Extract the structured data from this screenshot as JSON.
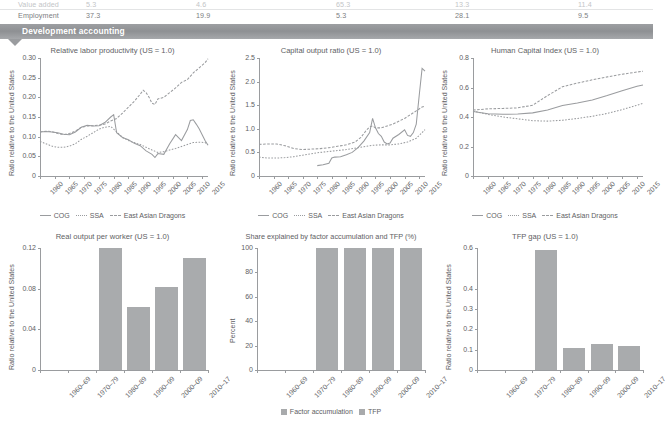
{
  "table_remnant": {
    "rows": [
      {
        "label": "Value added",
        "values": [
          "5.3",
          "4.6",
          "65.3",
          "13.3",
          "11.4"
        ]
      },
      {
        "label": "Employment",
        "values": [
          "37.3",
          "19.9",
          "5.3",
          "28.1",
          "9.5"
        ]
      }
    ]
  },
  "banner": {
    "title": "Development accounting"
  },
  "legend_lines": {
    "cog": "COG",
    "ssa": "SSA",
    "dragons": "East Asian Dragons"
  },
  "legend_bars": {
    "factor": "Factor accumulation",
    "tfp": "TFP"
  },
  "colors": {
    "line": "#9a9c9f",
    "bar": "#a9abad",
    "banner": "#9a9c9f",
    "text": "#5e6063"
  },
  "chart_data": [
    {
      "id": "relative-labor-productivity",
      "type": "line",
      "title": "Relative labor productivity (US = 1.0)",
      "xlabel": "",
      "ylabel": "Ratio relative to the United States",
      "xlim": [
        1960,
        2017
      ],
      "ylim": [
        0,
        0.3
      ],
      "yticks": [
        0,
        0.05,
        0.1,
        0.15,
        0.2,
        0.25,
        0.3
      ],
      "ytick_labels": [
        "0",
        "0.05",
        "0.10",
        "0.15",
        "0.20",
        "0.25",
        "0.30"
      ],
      "xticks": [
        1960,
        1965,
        1970,
        1975,
        1980,
        1985,
        1990,
        1995,
        2000,
        2005,
        2010,
        2015
      ],
      "xtick_labels": [
        "1960",
        "1965",
        "1970",
        "1975",
        "1980",
        "1985",
        "1990",
        "1995",
        "2000",
        "2005",
        "2010",
        "2015"
      ],
      "grid": false,
      "legend_position": "bottom",
      "series": [
        {
          "name": "COG",
          "style": "solid",
          "x": [
            1960,
            1962,
            1964,
            1966,
            1968,
            1970,
            1972,
            1974,
            1976,
            1978,
            1980,
            1982,
            1984,
            1985,
            1986,
            1988,
            1990,
            1992,
            1994,
            1996,
            1998,
            1999,
            2000,
            2002,
            2004,
            2006,
            2008,
            2010,
            2011,
            2012,
            2013,
            2014,
            2016,
            2017
          ],
          "y": [
            0.112,
            0.113,
            0.112,
            0.11,
            0.106,
            0.105,
            0.112,
            0.124,
            0.129,
            0.127,
            0.128,
            0.136,
            0.15,
            0.156,
            0.11,
            0.098,
            0.092,
            0.083,
            0.077,
            0.064,
            0.055,
            0.047,
            0.057,
            0.055,
            0.082,
            0.105,
            0.09,
            0.118,
            0.141,
            0.143,
            0.132,
            0.12,
            0.09,
            0.078
          ]
        },
        {
          "name": "SSA",
          "style": "dot",
          "x": [
            1960,
            1962,
            1964,
            1966,
            1968,
            1970,
            1972,
            1974,
            1976,
            1978,
            1980,
            1982,
            1984,
            1986,
            1988,
            1990,
            1992,
            1994,
            1996,
            1998,
            2000,
            2002,
            2004,
            2006,
            2008,
            2010,
            2012,
            2014,
            2016,
            2017
          ],
          "y": [
            0.088,
            0.082,
            0.076,
            0.073,
            0.073,
            0.076,
            0.082,
            0.093,
            0.101,
            0.11,
            0.119,
            0.124,
            0.126,
            0.112,
            0.098,
            0.09,
            0.085,
            0.08,
            0.073,
            0.066,
            0.06,
            0.062,
            0.066,
            0.07,
            0.075,
            0.08,
            0.085,
            0.086,
            0.085,
            0.08
          ]
        },
        {
          "name": "East Asian Dragons",
          "style": "dash",
          "x": [
            1960,
            1962,
            1964,
            1966,
            1968,
            1970,
            1972,
            1974,
            1976,
            1978,
            1980,
            1982,
            1984,
            1986,
            1988,
            1990,
            1992,
            1994,
            1995,
            1996,
            1997,
            1998,
            1999,
            2000,
            2002,
            2004,
            2006,
            2008,
            2010,
            2012,
            2014,
            2016,
            2017
          ],
          "y": [
            0.112,
            0.114,
            0.113,
            0.108,
            0.105,
            0.108,
            0.114,
            0.124,
            0.127,
            0.128,
            0.129,
            0.132,
            0.14,
            0.146,
            0.16,
            0.175,
            0.19,
            0.208,
            0.218,
            0.212,
            0.2,
            0.185,
            0.182,
            0.196,
            0.2,
            0.212,
            0.224,
            0.238,
            0.245,
            0.262,
            0.275,
            0.288,
            0.298
          ]
        }
      ]
    },
    {
      "id": "capital-output-ratio",
      "type": "line",
      "title": "Capital output ratio (US = 1.0)",
      "xlabel": "",
      "ylabel": "Ratio relative to the United States",
      "xlim": [
        1960,
        2017
      ],
      "ylim": [
        0,
        2.5
      ],
      "yticks": [
        0,
        0.5,
        1.0,
        1.5,
        2.0,
        2.5
      ],
      "ytick_labels": [
        "0",
        "0.5",
        "1.0",
        "1.5",
        "2.0",
        "2.5"
      ],
      "xticks": [
        1960,
        1965,
        1970,
        1975,
        1980,
        1985,
        1990,
        1995,
        2000,
        2005,
        2010,
        2015
      ],
      "xtick_labels": [
        "1960",
        "1965",
        "1970",
        "1975",
        "1980",
        "1985",
        "1990",
        "1995",
        "2000",
        "2005",
        "2010",
        "2015"
      ],
      "grid": false,
      "legend_position": "bottom",
      "series": [
        {
          "name": "COG",
          "style": "solid",
          "x": [
            1980,
            1982,
            1984,
            1985,
            1986,
            1988,
            1990,
            1992,
            1994,
            1996,
            1998,
            1999,
            2000,
            2001,
            2002,
            2003,
            2004,
            2005,
            2006,
            2008,
            2010,
            2011,
            2012,
            2013,
            2014,
            2015,
            2016,
            2017
          ],
          "y": [
            0.22,
            0.24,
            0.27,
            0.38,
            0.4,
            0.41,
            0.45,
            0.5,
            0.6,
            0.74,
            0.92,
            1.22,
            1.02,
            0.9,
            0.84,
            0.72,
            0.68,
            0.7,
            0.8,
            0.88,
            0.98,
            0.86,
            0.84,
            0.92,
            1.1,
            1.7,
            2.28,
            2.22
          ]
        },
        {
          "name": "SSA",
          "style": "dot",
          "x": [
            1960,
            1963,
            1966,
            1969,
            1972,
            1975,
            1978,
            1981,
            1984,
            1987,
            1990,
            1993,
            1996,
            1999,
            2002,
            2005,
            2008,
            2011,
            2014,
            2017
          ],
          "y": [
            0.4,
            0.38,
            0.38,
            0.39,
            0.41,
            0.44,
            0.47,
            0.5,
            0.52,
            0.54,
            0.56,
            0.59,
            0.62,
            0.65,
            0.66,
            0.66,
            0.68,
            0.72,
            0.8,
            0.98
          ]
        },
        {
          "name": "East Asian Dragons",
          "style": "dash",
          "x": [
            1960,
            1963,
            1966,
            1969,
            1972,
            1975,
            1978,
            1981,
            1984,
            1987,
            1990,
            1993,
            1995,
            1996,
            1997,
            1998,
            1999,
            2000,
            2002,
            2004,
            2006,
            2008,
            2010,
            2012,
            2014,
            2016,
            2017
          ],
          "y": [
            0.67,
            0.68,
            0.68,
            0.64,
            0.58,
            0.56,
            0.57,
            0.58,
            0.6,
            0.63,
            0.66,
            0.72,
            0.82,
            0.9,
            0.98,
            1.04,
            1.06,
            1.02,
            1.02,
            1.06,
            1.1,
            1.16,
            1.22,
            1.3,
            1.38,
            1.46,
            1.48
          ]
        }
      ]
    },
    {
      "id": "human-capital-index",
      "type": "line",
      "title": "Human Capital Index (US = 1.0)",
      "xlabel": "",
      "ylabel": "Ratio relative to the United States",
      "xlim": [
        1960,
        2017
      ],
      "ylim": [
        0,
        0.8
      ],
      "yticks": [
        0,
        0.2,
        0.4,
        0.6,
        0.8
      ],
      "ytick_labels": [
        "0",
        "0.2",
        "0.4",
        "0.6",
        "0.8"
      ],
      "xticks": [
        1960,
        1965,
        1970,
        1975,
        1980,
        1985,
        1990,
        1995,
        2000,
        2005,
        2010,
        2015
      ],
      "xtick_labels": [
        "1960",
        "1965",
        "1970",
        "1975",
        "1980",
        "1985",
        "1990",
        "1995",
        "2000",
        "2005",
        "2010",
        "2015"
      ],
      "grid": false,
      "legend_position": "bottom",
      "series": [
        {
          "name": "COG",
          "style": "solid",
          "x": [
            1960,
            1965,
            1970,
            1975,
            1980,
            1985,
            1990,
            1995,
            2000,
            2005,
            2010,
            2015,
            2017
          ],
          "y": [
            0.437,
            0.422,
            0.418,
            0.42,
            0.428,
            0.448,
            0.478,
            0.495,
            0.515,
            0.545,
            0.578,
            0.608,
            0.617
          ]
        },
        {
          "name": "SSA",
          "style": "dot",
          "x": [
            1960,
            1965,
            1970,
            1975,
            1980,
            1985,
            1990,
            1995,
            2000,
            2005,
            2010,
            2015,
            2017
          ],
          "y": [
            0.44,
            0.418,
            0.4,
            0.388,
            0.375,
            0.372,
            0.378,
            0.39,
            0.405,
            0.424,
            0.45,
            0.48,
            0.492
          ]
        },
        {
          "name": "East Asian Dragons",
          "style": "dash",
          "x": [
            1960,
            1965,
            1970,
            1975,
            1980,
            1985,
            1990,
            1995,
            2000,
            2005,
            2010,
            2015,
            2017
          ],
          "y": [
            0.447,
            0.455,
            0.458,
            0.462,
            0.48,
            0.545,
            0.605,
            0.63,
            0.652,
            0.672,
            0.69,
            0.705,
            0.71
          ]
        }
      ]
    },
    {
      "id": "real-output-per-worker",
      "type": "bar",
      "title": "Real output per worker (US = 1.0)",
      "xlabel": "",
      "ylabel": "Ratio relative to the United States",
      "categories": [
        "1960–69",
        "1970–79",
        "1980–89",
        "1990–99",
        "2000–09",
        "2010–17"
      ],
      "values": [
        0,
        0,
        0.12,
        0.062,
        0.082,
        0.11
      ],
      "ylim": [
        0,
        0.12
      ],
      "yticks": [
        0,
        0.04,
        0.08,
        0.12
      ],
      "ytick_labels": [
        "0",
        "0.04",
        "0.08",
        "0.12"
      ],
      "grid": false
    },
    {
      "id": "share-factor-accumulation-tfp",
      "type": "bar",
      "title": "Share explained by factor accumulation and TFP (%)",
      "xlabel": "",
      "ylabel": "Percent",
      "categories": [
        "1960–69",
        "1970–79",
        "1980–89",
        "1990–99",
        "2000–09",
        "2010–17"
      ],
      "ylim": [
        0,
        100
      ],
      "yticks": [
        0,
        20,
        40,
        60,
        80,
        100
      ],
      "ytick_labels": [
        "0",
        "20",
        "40",
        "60",
        "80",
        "100"
      ],
      "stacked": true,
      "grid": false,
      "legend_position": "bottom",
      "series": [
        {
          "name": "Factor accumulation",
          "values": [
            0,
            0,
            100,
            100,
            100,
            100
          ]
        },
        {
          "name": "TFP",
          "values": [
            0,
            0,
            0,
            0,
            0,
            0
          ]
        }
      ]
    },
    {
      "id": "tfp-gap",
      "type": "bar",
      "title": "TFP gap (US = 1.0)",
      "xlabel": "",
      "ylabel": "Ratio relative to the United States",
      "categories": [
        "1960–69",
        "1970–79",
        "1980–89",
        "1990–99",
        "2000–09",
        "2010–17"
      ],
      "values": [
        0,
        0,
        0.59,
        0.11,
        0.13,
        0.12
      ],
      "ylim": [
        0,
        0.6
      ],
      "yticks": [
        0,
        0.1,
        0.2,
        0.3,
        0.4,
        0.6
      ],
      "ytick_labels": [
        "0",
        "0.1",
        "0.2",
        "0.3",
        "0.4",
        "0.6"
      ],
      "grid": false
    }
  ]
}
